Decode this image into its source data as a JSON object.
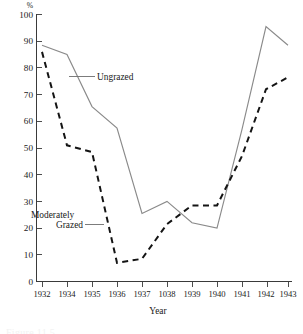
{
  "chart_data": {
    "type": "line",
    "title": "",
    "xlabel": "Year",
    "ylabel": "%",
    "unit_label": "%",
    "x": [
      "1932",
      "1934",
      "1935",
      "1936",
      "1937",
      "1038",
      "1939",
      "1940",
      "1941",
      "1942",
      "1943"
    ],
    "xtick_labels": [
      "1932",
      "1934",
      "1935",
      "1936",
      "1937",
      "1038",
      "1939",
      "1940",
      "1941",
      "1942",
      "1943"
    ],
    "ytick_labels": [
      "0",
      "10",
      "20",
      "30",
      "40",
      "50",
      "60",
      "70",
      "80",
      "90",
      "100"
    ],
    "ytick_values": [
      0,
      10,
      20,
      30,
      40,
      50,
      60,
      70,
      80,
      90,
      100
    ],
    "ylim": [
      0,
      100
    ],
    "grid": false,
    "legend_position": "inline-annotations",
    "series": [
      {
        "name": "Ungrazed",
        "style": "solid",
        "color": "#8a8a8a",
        "values": [
          88.5,
          85.0,
          65.5,
          57.5,
          25.5,
          30.0,
          22.0,
          20.0,
          57.0,
          95.5,
          88.5
        ]
      },
      {
        "name": "Moderately Grazed",
        "style": "dashed",
        "color": "#141414",
        "values": [
          86.0,
          51.0,
          48.5,
          7.0,
          8.5,
          21.5,
          28.5,
          28.5,
          47.0,
          72.0,
          76.5
        ]
      }
    ],
    "annotations": [
      {
        "name": "ungrazed",
        "text": "Ungrazed"
      },
      {
        "name": "moderately-grazed-line1",
        "text": "Moderately"
      },
      {
        "name": "moderately-grazed-line2",
        "text": "Grazed"
      }
    ]
  },
  "figure": {
    "caption": "Figure 11.5"
  },
  "colors": {
    "ungrazed": "#8a8a8a",
    "moderately_grazed": "#141414",
    "axis": "#3a3a3a",
    "text": "#1a1a1a",
    "background": "#ffffff"
  }
}
